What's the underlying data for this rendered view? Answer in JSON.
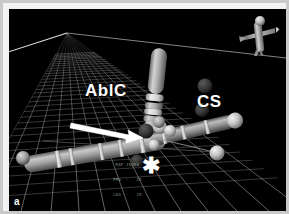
{
  "window": {
    "title": "CARTO 3D Electroanatomic Map",
    "panel_letter": "a",
    "background_color": "#000000",
    "frame_color": "#f2f2f2"
  },
  "viewport": {
    "grid": {
      "name": "perspective-floor-grid",
      "line_color": "#8f8f8f",
      "horizon_color": "#e8e8e8",
      "visible": true
    },
    "readout_lines": [
      "RAF 35@50",
      "PMa  -   25",
      "LAO  -   15"
    ]
  },
  "annotations": {
    "ablation_catheter_label": "AblC",
    "coronary_sinus_label": "CS",
    "asterisk_marker": "✱",
    "arrow": {
      "name": "pointer-arrow",
      "color": "#ffffff",
      "points_to": "ablation-lesion-tag"
    }
  },
  "orientation": {
    "icon_name": "body-orientation-icon",
    "description": "torso orientation reference figure"
  },
  "structures": [
    {
      "name": "ablation-catheter",
      "label": "AblC",
      "color": "#b9b9b9",
      "orientation": "vertical"
    },
    {
      "name": "coronary-sinus-catheter",
      "label": "CS",
      "color": "#a9a9a9",
      "orientation": "diagonal"
    },
    {
      "name": "mapped-vessel-shaft",
      "color": "#8e8e8e",
      "orientation": "diagonal-lower-left"
    }
  ],
  "lesion_tags": [
    {
      "name": "lesion-tag-1",
      "color": "#3a3a3a"
    },
    {
      "name": "lesion-tag-2",
      "color": "#3e3e3e"
    },
    {
      "name": "lesion-tag-3",
      "color": "#303030"
    },
    {
      "name": "lesion-tag-4",
      "color": "#2b2b2b"
    }
  ],
  "electrode_markers": [
    {
      "name": "electrode-marker-1",
      "color": "#d8d8d8"
    },
    {
      "name": "electrode-marker-2",
      "color": "#dcdcdc"
    },
    {
      "name": "electrode-marker-3",
      "color": "#cccccc"
    },
    {
      "name": "electrode-marker-4",
      "color": "#d0d0d0"
    },
    {
      "name": "electrode-marker-5",
      "color": "#c4c4c4"
    }
  ]
}
